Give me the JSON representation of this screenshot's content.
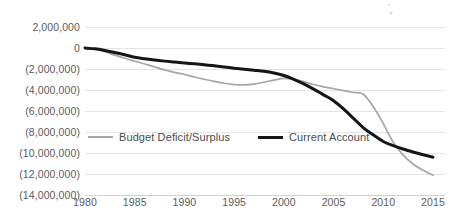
{
  "chart_data": {
    "type": "line",
    "title": "",
    "subtitle": "",
    "xlabel": "",
    "ylabel": "",
    "xlim": [
      1980,
      2015
    ],
    "ylim": [
      -14000000,
      2000000
    ],
    "grid": true,
    "legend_position": "inside-lower-left",
    "y_ticks": [
      2000000,
      0,
      -2000000,
      -4000000,
      -6000000,
      -8000000,
      -10000000,
      -12000000,
      -14000000
    ],
    "y_tick_labels": [
      "2,000,000",
      "0",
      "(2,000,000)",
      "(4,000,000)",
      "(6,000,000)",
      "(8,000,000)",
      "(10,000,000)",
      "(12,000,000)",
      "(14,000,000)"
    ],
    "x_ticks": [
      1980,
      1985,
      1990,
      1995,
      2000,
      2005,
      2010,
      2015
    ],
    "x_tick_labels": [
      "1980",
      "1985",
      "1990",
      "1995",
      "2000",
      "2005",
      "2010",
      "2015"
    ],
    "x": [
      1980,
      1981,
      1982,
      1983,
      1984,
      1985,
      1986,
      1987,
      1988,
      1989,
      1990,
      1991,
      1992,
      1993,
      1994,
      1995,
      1996,
      1997,
      1998,
      1999,
      2000,
      2001,
      2002,
      2003,
      2004,
      2005,
      2006,
      2007,
      2008,
      2009,
      2010,
      2011,
      2012,
      2013,
      2014,
      2015
    ],
    "series": [
      {
        "name": "Budget Deficit/Surplus",
        "color": "#a6a6a6",
        "line_width": 1.7,
        "values": [
          0,
          -120000,
          -350000,
          -680000,
          -980000,
          -1250000,
          -1520000,
          -1800000,
          -2080000,
          -2320000,
          -2520000,
          -2760000,
          -2980000,
          -3180000,
          -3360000,
          -3480000,
          -3520000,
          -3440000,
          -3260000,
          -3060000,
          -2900000,
          -2980000,
          -3200000,
          -3480000,
          -3700000,
          -3880000,
          -4060000,
          -4240000,
          -4400000,
          -5600000,
          -7200000,
          -8960000,
          -10200000,
          -11050000,
          -11650000,
          -12100000
        ]
      },
      {
        "name": "Current Account",
        "color": "#151515",
        "line_width": 3.0,
        "values": [
          0,
          -80000,
          -230000,
          -420000,
          -640000,
          -880000,
          -1020000,
          -1140000,
          -1250000,
          -1340000,
          -1420000,
          -1510000,
          -1600000,
          -1700000,
          -1810000,
          -1920000,
          -2020000,
          -2120000,
          -2220000,
          -2380000,
          -2620000,
          -2980000,
          -3420000,
          -3920000,
          -4460000,
          -5020000,
          -5800000,
          -6700000,
          -7600000,
          -8280000,
          -8900000,
          -9300000,
          -9620000,
          -9900000,
          -10160000,
          -10400000
        ]
      }
    ]
  },
  "legend": {
    "entries": [
      {
        "label": "Budget Deficit/Surplus"
      },
      {
        "label": "Current Account"
      }
    ]
  }
}
